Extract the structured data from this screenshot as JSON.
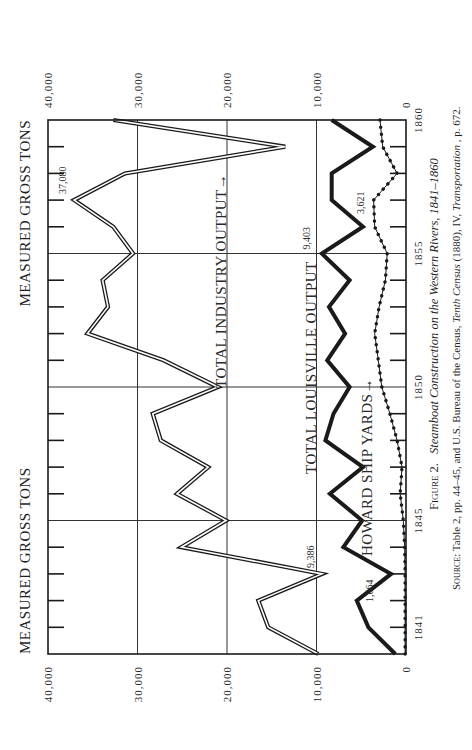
{
  "figure": {
    "caption_prefix": "Figure 2.",
    "caption_title": "Steamboat Construction on the Western Rivers, 1841–1860",
    "source_prefix": "Source:",
    "source_text_1": " Table 2, pp. 44–45, and U.S. Bureau of the Census, ",
    "source_italic_1": "Tenth Census",
    "source_text_2": " (1880), IV, ",
    "source_italic_2": "Transportation",
    "source_text_3": ", p. 672."
  },
  "labels": {
    "y_axis_title_left": "MEASURED GROSS TONS",
    "y_axis_title_right": "MEASURED GROSS TONS",
    "series_industry": "TOTAL INDUSTRY OUTPUT→",
    "series_louisville": "TOTAL LOUISVILLE OUTPUT",
    "series_howard": "HOWARD SHIP YARDS→"
  },
  "chart_data": {
    "type": "line",
    "title": "Steamboat Construction on the Western Rivers, 1841–1860",
    "xlabel": "Year",
    "ylabel": "Measured Gross Tons",
    "orientation_note": "figure printed rotated 90° counter-clockwise on page",
    "x_ticks": [
      1841,
      1845,
      1850,
      1855,
      1860
    ],
    "x_tick_labels": [
      "1841",
      "1845",
      "1850",
      "1855",
      "1860"
    ],
    "y_ticks": [
      0,
      10000,
      20000,
      30000,
      40000
    ],
    "y_tick_labels": [
      "0",
      "10,000",
      "20,000",
      "30,000",
      "40,000"
    ],
    "xlim": [
      1840,
      1860
    ],
    "ylim": [
      0,
      40000
    ],
    "grid": {
      "x": [
        1845,
        1850,
        1855
      ],
      "y": [
        10000,
        20000,
        30000
      ]
    },
    "x": [
      1840,
      1841,
      1842,
      1843,
      1844,
      1845,
      1846,
      1847,
      1848,
      1849,
      1850,
      1851,
      1852,
      1853,
      1854,
      1855,
      1856,
      1857,
      1858,
      1859,
      1860
    ],
    "series": [
      {
        "name": "Total Industry Output",
        "style": "double-line",
        "values": [
          9800,
          15400,
          16500,
          9386,
          25100,
          20100,
          25600,
          22100,
          27400,
          28300,
          21000,
          27100,
          35600,
          33300,
          33900,
          30500,
          32700,
          37080,
          31400,
          13500,
          32700
        ]
      },
      {
        "name": "Total Louisville Output",
        "style": "thick-line",
        "values": [
          1200,
          4200,
          5500,
          1664,
          7000,
          4900,
          8500,
          4800,
          9000,
          8100,
          6300,
          8800,
          6800,
          8600,
          6300,
          9403,
          4800,
          8300,
          8300,
          3700,
          8300
        ]
      },
      {
        "name": "Howard Ship Yards",
        "style": "dotted-line",
        "values": [
          100,
          100,
          100,
          100,
          150,
          300,
          650,
          450,
          1000,
          1800,
          2700,
          3100,
          3500,
          3000,
          2300,
          2100,
          3500,
          3621,
          1000,
          2600,
          2900
        ]
      }
    ],
    "annotations": [
      {
        "text": "9,386",
        "x": 1843,
        "series": "Total Industry Output"
      },
      {
        "text": "37,080",
        "x": 1857,
        "series": "Total Industry Output"
      },
      {
        "text": "1,664",
        "x": 1843,
        "series": "Total Louisville Output"
      },
      {
        "text": "9,403",
        "x": 1855,
        "series": "Total Louisville Output"
      },
      {
        "text": "3,621",
        "x": 1857,
        "series": "Howard Ship Yards"
      }
    ]
  },
  "colors": {
    "ink": "#1a1a1a",
    "grid": "#333333",
    "paper": "#ffffff"
  }
}
